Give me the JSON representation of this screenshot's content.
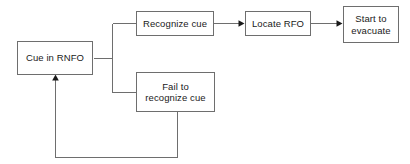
{
  "diagram": {
    "type": "flowchart",
    "background_color": "#ffffff",
    "line_color": "#6e6e6e",
    "text_color": "#1a1a1a",
    "nodes": [
      {
        "id": "cue_in_rnfo",
        "label": "Cue in RNFO"
      },
      {
        "id": "recognize_cue",
        "label": "Recognize cue"
      },
      {
        "id": "locate_rfo",
        "label": "Locate RFO"
      },
      {
        "id": "start_evacuate",
        "label": "Start to\nevacuate"
      },
      {
        "id": "fail_recognize",
        "label": "Fail to\nrecognize cue"
      }
    ],
    "edges": [
      {
        "id": "cue-to-branch",
        "from": "cue_in_rnfo",
        "to": "branch",
        "arrow": false
      },
      {
        "id": "branch-to-recognize",
        "from": "branch",
        "to": "recognize_cue",
        "arrow": false
      },
      {
        "id": "branch-to-fail",
        "from": "branch",
        "to": "fail_recognize",
        "arrow": false
      },
      {
        "id": "recognize-to-locate",
        "from": "recognize_cue",
        "to": "locate_rfo",
        "arrow": true
      },
      {
        "id": "locate-to-start",
        "from": "locate_rfo",
        "to": "start_evacuate",
        "arrow": true
      },
      {
        "id": "fail-to-cue-feedback",
        "from": "fail_recognize",
        "to": "cue_in_rnfo",
        "arrow": true
      }
    ]
  }
}
